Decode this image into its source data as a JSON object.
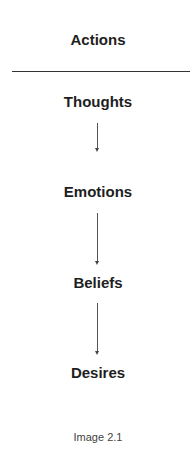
{
  "diagram": {
    "top_label": "Actions",
    "nodes": [
      "Thoughts",
      "Emotions",
      "Beliefs",
      "Desires"
    ],
    "edges": [
      {
        "from": "Thoughts",
        "to": "Emotions"
      },
      {
        "from": "Emotions",
        "to": "Beliefs"
      },
      {
        "from": "Beliefs",
        "to": "Desires"
      }
    ],
    "caption": "Image 2.1"
  }
}
